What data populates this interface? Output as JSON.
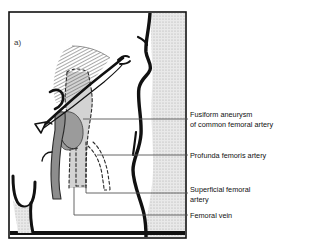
{
  "figure": {
    "panel_letter": "a)",
    "background_color": "#ffffff",
    "border_color": "#111111",
    "panel": {
      "x": 9,
      "y": 12,
      "width": 177,
      "height": 226
    }
  },
  "colors": {
    "outline": "#111111",
    "vein_fill": "#cfcfcf",
    "artery_fill": "#8f8f8f",
    "aneurysm_fill": "#9a9a9a",
    "hatch_stroke": "#4a4a4a",
    "stipple_fill": "#d9d9d9",
    "leader_line": "#555555",
    "text": "#111111"
  },
  "anatomy": {
    "structures": [
      {
        "name": "inguinal-ligament-muscle",
        "style": "diagonal-hatch"
      },
      {
        "name": "common-femoral-artery",
        "style": "solid-dark-gray"
      },
      {
        "name": "fusiform-aneurysm",
        "style": "solid-mid-gray"
      },
      {
        "name": "femoral-vein",
        "style": "light-gray-dashed-outline"
      },
      {
        "name": "profunda-femoris-artery",
        "style": "dashed-outline"
      },
      {
        "name": "superficial-femoral-artery",
        "style": "dashed-outline"
      },
      {
        "name": "body-contour",
        "style": "thick-black-curve"
      },
      {
        "name": "stippled-band",
        "style": "light-stipple"
      },
      {
        "name": "opposite-limb-outline",
        "style": "u-shape-outline"
      }
    ]
  },
  "labels": [
    {
      "id": "fusiform-aneurysm",
      "lines": [
        "Fusiform aneurysm",
        "of common femoral artery"
      ],
      "text_x": 190,
      "text_y": 114,
      "leader": {
        "x1": 83,
        "y1": 119,
        "x2": 188,
        "y2": 119
      }
    },
    {
      "id": "profunda-femoris-artery",
      "lines": [
        "Profunda femoris artery"
      ],
      "text_x": 190,
      "text_y": 158,
      "leader": {
        "x1": 97,
        "y1": 155,
        "x2": 188,
        "y2": 155
      }
    },
    {
      "id": "superficial-femoral-artery",
      "lines": [
        "Superficial femoral",
        "artery"
      ],
      "text_x": 190,
      "text_y": 190,
      "leader": {
        "x1": 86,
        "y1": 187,
        "x2": 188,
        "y2": 193
      }
    },
    {
      "id": "femoral-vein",
      "lines": [
        "Femoral vein"
      ],
      "text_x": 190,
      "text_y": 218,
      "leader": {
        "x1": 74,
        "y1": 187,
        "x2": 188,
        "y2": 215
      }
    }
  ]
}
